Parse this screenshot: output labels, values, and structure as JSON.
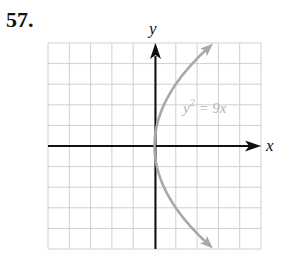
{
  "problem": {
    "number": "57."
  },
  "chart_data": {
    "type": "line",
    "title": "",
    "xlabel": "x",
    "ylabel": "y",
    "xlim": [
      -5,
      5
    ],
    "ylim": [
      -5,
      5
    ],
    "grid": true,
    "grid_step": 1,
    "series": [
      {
        "name": "y^2 = 9x",
        "label": "y² = 9x",
        "equation": "y^2 = 9x",
        "color": "#a8a8a8",
        "points": [
          {
            "x": 2.78,
            "y": -5
          },
          {
            "x": 1.78,
            "y": -4
          },
          {
            "x": 1.0,
            "y": -3
          },
          {
            "x": 0.44,
            "y": -2
          },
          {
            "x": 0.11,
            "y": -1
          },
          {
            "x": 0,
            "y": 0
          },
          {
            "x": 0.11,
            "y": 1
          },
          {
            "x": 0.44,
            "y": 2
          },
          {
            "x": 1.0,
            "y": 3
          },
          {
            "x": 1.78,
            "y": 4
          },
          {
            "x": 2.78,
            "y": 5
          }
        ]
      }
    ],
    "annotations": [
      {
        "text": "y² = 9x",
        "x": 2.2,
        "y": 1.7
      }
    ]
  },
  "labels": {
    "x_axis": "x",
    "y_axis": "y",
    "curve_base": "y",
    "curve_exp": "2",
    "curve_rest": " = 9x"
  },
  "colors": {
    "axis": "#111111",
    "grid": "#cfcfcf",
    "curve": "#a8a8a8",
    "curve_label": "#b4b4b4"
  }
}
